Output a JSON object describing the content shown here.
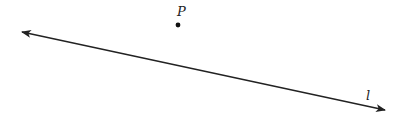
{
  "diagram": {
    "type": "geometry",
    "line": {
      "label": "l",
      "start": [
        22,
        32
      ],
      "end": [
        385,
        110
      ],
      "color": "#222222",
      "arrows": "both"
    },
    "point": {
      "label": "P",
      "position": [
        178,
        25
      ],
      "color": "#111111"
    }
  }
}
